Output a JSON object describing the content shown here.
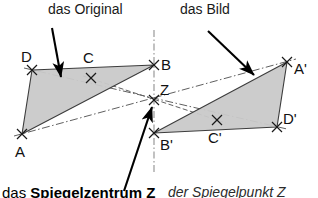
{
  "figure": {
    "title_left": "das Original",
    "title_right": "das Bild",
    "caption_left_prefix": "das ",
    "caption_left_bold": "Spiegelzentrum Z",
    "caption_right": "der Spiegelpunkt Z",
    "colors": {
      "triangle_fill": "#c8c8c8",
      "triangle_stroke": "#3c3c3c",
      "dashed_line": "#5a5a5a",
      "mirror_axis": "#8c8c8c",
      "arrow": "#000000",
      "text": "#111111",
      "background": "#ffffff"
    },
    "mirror_axis": {
      "label": "vertical-mirror-axis",
      "x": 154,
      "y_top": 30,
      "y_bottom": 172,
      "style": "dash-dot"
    },
    "center": {
      "label": "Z",
      "x": 154,
      "y": 100
    },
    "original_triangle": {
      "label": "das Original",
      "vertices": [
        {
          "label": "A",
          "x": 22,
          "y": 134,
          "label_x": 17,
          "label_y": 152
        },
        {
          "label": "B",
          "x": 154,
          "y": 65,
          "label_x": 160,
          "label_y": 66
        },
        {
          "label": "D",
          "x": 32,
          "y": 70,
          "label_x": 22,
          "label_y": 62
        },
        {
          "label": "C",
          "x": 91,
          "y": 78,
          "label_x": 85,
          "label_y": 62
        }
      ],
      "fill_path": "M 22 134 L 32 70 L 154 65 Z"
    },
    "image_triangle": {
      "label": "das Bild",
      "vertices": [
        {
          "label": "A'",
          "x": 287,
          "y": 62,
          "label_x": 293,
          "label_y": 76
        },
        {
          "label": "B'",
          "x": 154,
          "y": 133,
          "label_x": 159,
          "label_y": 148
        },
        {
          "label": "D'",
          "x": 277,
          "y": 127,
          "label_x": 282,
          "label_y": 122
        },
        {
          "label": "C'",
          "x": 217,
          "y": 120,
          "label_x": 210,
          "label_y": 141
        }
      ],
      "fill_path": "M 287 62 L 277 127 L 154 133 Z"
    },
    "connection_lines": [
      {
        "name": "line-A-to-Aprime",
        "x1": 22,
        "y1": 134,
        "x2": 287,
        "y2": 62
      },
      {
        "name": "line-B-to-Bprime",
        "x1": 154,
        "y1": 65,
        "x2": 154,
        "y2": 133
      },
      {
        "name": "line-C-to-Cprime",
        "x1": 91,
        "y1": 78,
        "x2": 217,
        "y2": 120
      },
      {
        "name": "line-D-to-Dprime",
        "x1": 32,
        "y1": 70,
        "x2": 277,
        "y2": 127
      }
    ],
    "arrows": [
      {
        "name": "arrow-to-original",
        "x1": 52,
        "y1": 28,
        "x2": 60,
        "y2": 76
      },
      {
        "name": "arrow-to-image",
        "x1": 209,
        "y1": 32,
        "x2": 253,
        "y2": 74
      },
      {
        "name": "arrow-to-center",
        "x1": 125,
        "y1": 190,
        "x2": 152,
        "y2": 106
      }
    ]
  }
}
